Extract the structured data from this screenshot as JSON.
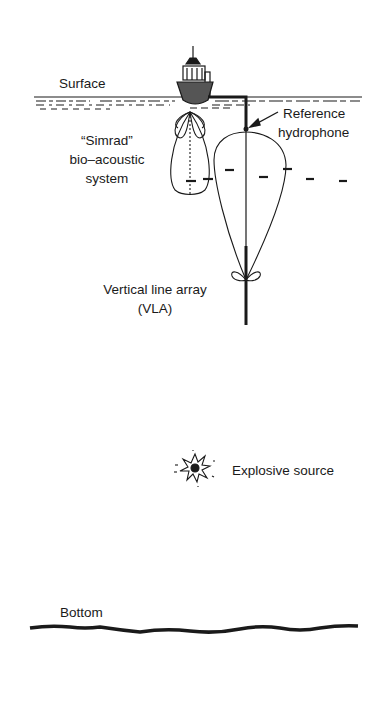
{
  "diagram": {
    "labels": {
      "surface": "Surface",
      "reference_line1": "Reference",
      "reference_line2": "hydrophone",
      "simrad_line1": "“Simrad”",
      "simrad_line2": "bio–acoustic",
      "simrad_line3": "system",
      "vla_line1": "Vertical line array",
      "vla_line2": "(VLA)",
      "explosive": "Explosive source",
      "bottom": "Bottom"
    },
    "elements": {
      "ship": "ship-icon",
      "sea_surface": "wavy-surface",
      "simrad_beam": "sonar-beam-pattern",
      "vla_beam": "array-beam-pattern",
      "vla": "vertical-line-array",
      "fish": "fish-icons",
      "explosion": "explosion-icon",
      "seabed": "seabed-line"
    },
    "colors": {
      "ink": "#1a1a1a",
      "background": "#ffffff"
    }
  }
}
